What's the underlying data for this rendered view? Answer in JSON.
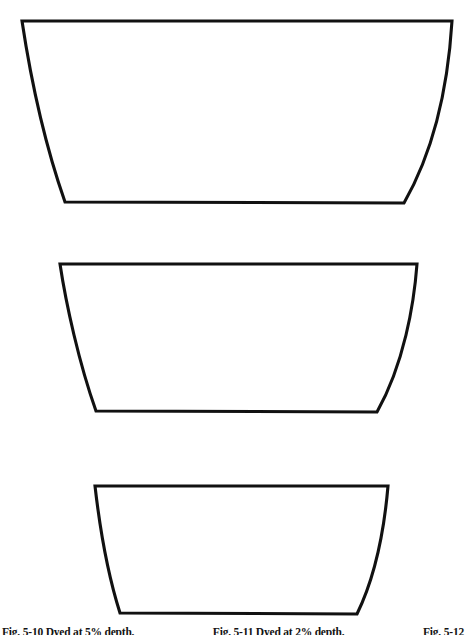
{
  "page": {
    "width": 466,
    "height": 635,
    "background_color": "#ffffff",
    "ink_color": "#111111",
    "media_type": "line-drawing"
  },
  "figures": [
    {
      "id": "trapezoid-large",
      "label": "large-trapezoid",
      "top_left": [
        22,
        21
      ],
      "top_right": [
        452,
        21
      ],
      "bottom_right": [
        404,
        203
      ],
      "bottom_left": [
        65,
        202
      ],
      "top_width": 430,
      "bottom_width": 339,
      "height": 182,
      "stroke_width": 3.1,
      "fill": "#ffffff",
      "stroke": "#111111"
    },
    {
      "id": "trapezoid-medium",
      "label": "medium-trapezoid",
      "top_left": [
        60,
        264
      ],
      "top_right": [
        417,
        264
      ],
      "bottom_right": [
        377,
        412
      ],
      "bottom_left": [
        96,
        411
      ],
      "top_width": 357,
      "bottom_width": 281,
      "height": 148,
      "stroke_width": 3.1,
      "fill": "#ffffff",
      "stroke": "#111111"
    },
    {
      "id": "trapezoid-small",
      "label": "small-trapezoid",
      "top_left": [
        95,
        486
      ],
      "top_right": [
        388,
        486
      ],
      "bottom_right": [
        357,
        614
      ],
      "bottom_left": [
        120,
        613
      ],
      "top_width": 293,
      "bottom_width": 237,
      "height": 128,
      "stroke_width": 3.1,
      "fill": "#ffffff",
      "stroke": "#111111"
    }
  ],
  "caption": {
    "clipped": true,
    "items": [
      "Fig. 5-10 Dyed at 5% depth.",
      "Fig. 5-11 Dyed at 2% depth.",
      "Fig. 5-12"
    ]
  }
}
